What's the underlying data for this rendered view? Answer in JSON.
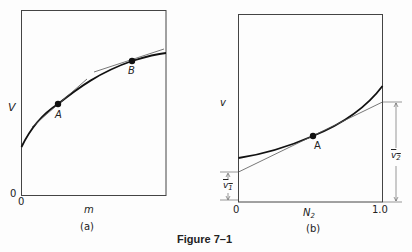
{
  "figure": {
    "caption": "Figure 7–1",
    "panels": [
      {
        "id": "a",
        "panel_label": "(a)",
        "y_axis_label": "V",
        "x_axis_label": "m",
        "x_origin_label": "0",
        "y_origin_label": "0",
        "points": [
          {
            "label": "A"
          },
          {
            "label": "B"
          }
        ],
        "description": "Concave curve of V vs m with tangent lines drawn at points A and B"
      },
      {
        "id": "b",
        "panel_label": "(b)",
        "y_axis_label": "v",
        "x_axis_label": "N",
        "x_axis_label_sub": "2",
        "x_origin_label": "0",
        "x_end_label": "1.0",
        "points": [
          {
            "label": "A"
          }
        ],
        "intercept_left": {
          "label": "v",
          "sub": "1",
          "bar": true
        },
        "intercept_right": {
          "label": "v",
          "sub": "2",
          "bar": true
        },
        "description": "Convex curve of v vs N2 with tangent at A; tangent intercepts at N2=0 and N2=1.0 give partial molar volumes v̄1 and v̄2"
      }
    ]
  }
}
